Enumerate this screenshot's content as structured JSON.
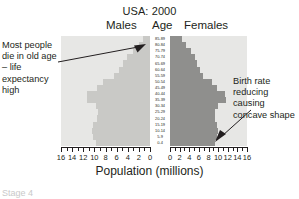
{
  "chart_data": {
    "type": "bar",
    "title": "USA: 2000",
    "subtype": "population-pyramid",
    "xlabel": "Population (millions)",
    "ylabel": "Age",
    "grid": false,
    "legend_position": "top",
    "column_headers": {
      "left": "Males",
      "center": "Age",
      "right": "Females"
    },
    "categories": [
      "85-89",
      "80-84",
      "75-79",
      "70-74",
      "65-69",
      "60-64",
      "55-59",
      "50-54",
      "45-49",
      "40-44",
      "35-39",
      "30-34",
      "25-29",
      "20-24",
      "15-19",
      "10-14",
      "5-9",
      "0-4"
    ],
    "series": [
      {
        "name": "Males",
        "values": [
          1.2,
          1.9,
          3.0,
          4.1,
          4.9,
          5.6,
          6.4,
          8.4,
          9.5,
          11.3,
          11.4,
          9.8,
          9.3,
          9.5,
          10.2,
          10.5,
          10.2,
          9.8
        ]
      },
      {
        "name": "Females",
        "values": [
          2.4,
          3.3,
          4.4,
          5.2,
          5.6,
          6.2,
          6.8,
          8.7,
          9.8,
          11.5,
          11.6,
          10.0,
          9.3,
          9.3,
          9.7,
          10.0,
          9.7,
          9.4
        ]
      }
    ],
    "left_axis": {
      "label": "Males",
      "ticks": [
        "16",
        "14",
        "12",
        "10",
        "8",
        "6",
        "4",
        "2",
        "0"
      ],
      "range": [
        16,
        0
      ],
      "direction": "reversed"
    },
    "right_axis": {
      "label": "Females",
      "ticks": [
        "0",
        "2",
        "4",
        "6",
        "8",
        "10",
        "12",
        "14",
        "16"
      ],
      "range": [
        0,
        16
      ],
      "direction": "normal"
    },
    "colors": {
      "panel_background": "#e7e7e5",
      "males_bar": "#c9c9c6",
      "females_bar": "#8f8f8d",
      "text": "#231f20",
      "page_background": "#ffffff"
    },
    "annotations": [
      {
        "id": "left",
        "text": "Most people die in old age – life expectancy high",
        "points_to": "85-89 male bar"
      },
      {
        "id": "right",
        "text": "Birth rate reducing causing concave shape",
        "points_to": "0-4 female bar"
      }
    ]
  },
  "annotation_left": "Most people die in old age – life expectancy high",
  "annotation_right": "Birth rate reducing causing concave shape",
  "cutoff_text": "Stage 4"
}
